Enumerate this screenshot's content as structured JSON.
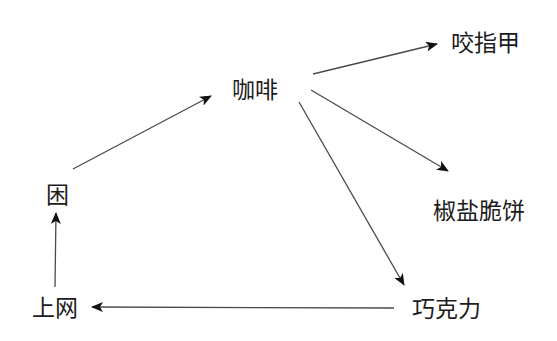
{
  "diagram": {
    "type": "directed-graph",
    "nodes": [
      {
        "id": "coffee",
        "label": "咖啡"
      },
      {
        "id": "nail",
        "label": "咬指甲"
      },
      {
        "id": "pretzel",
        "label": "椒盐脆饼"
      },
      {
        "id": "sleepy",
        "label": "困"
      },
      {
        "id": "online",
        "label": "上网"
      },
      {
        "id": "chocolate",
        "label": "巧克力"
      }
    ],
    "edges": [
      {
        "from": "coffee",
        "to": "nail"
      },
      {
        "from": "coffee",
        "to": "pretzel"
      },
      {
        "from": "coffee",
        "to": "chocolate"
      },
      {
        "from": "chocolate",
        "to": "online"
      },
      {
        "from": "online",
        "to": "sleepy"
      },
      {
        "from": "sleepy",
        "to": "coffee"
      }
    ],
    "colors": {
      "line": "#4a4a4a",
      "arrowhead": "#111111",
      "text": "#1c1c1c"
    }
  }
}
